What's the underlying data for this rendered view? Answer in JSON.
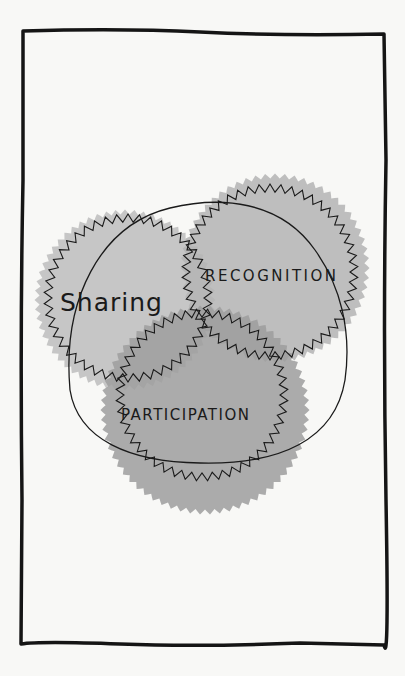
{
  "diagram": {
    "type": "venn",
    "sets": [
      {
        "id": "sharing",
        "label": "Sharing",
        "fill": "#bdbdbd"
      },
      {
        "id": "recognition",
        "label": "RECOGNITION",
        "fill": "#b4b4b4"
      },
      {
        "id": "participation",
        "label": "PARTICIPATION",
        "fill": "#9d9d9d"
      }
    ],
    "enclosure": "hand-drawn outline enclosing all three sets",
    "frame": "hand-drawn black rectangular border"
  },
  "colors": {
    "background": "#f8f8f6",
    "ink": "#1a1a1a",
    "frame": "#151515"
  }
}
